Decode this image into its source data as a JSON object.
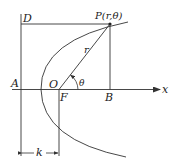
{
  "figure": {
    "labels": {
      "D": "D",
      "P": "P(r,θ)",
      "r": "r",
      "theta": "θ",
      "A": "A",
      "O": "O",
      "F": "F",
      "B": "B",
      "x": "x",
      "k": "k"
    },
    "colors": {
      "stroke": "#333333",
      "text": "#222222",
      "background": "#ffffff"
    }
  }
}
